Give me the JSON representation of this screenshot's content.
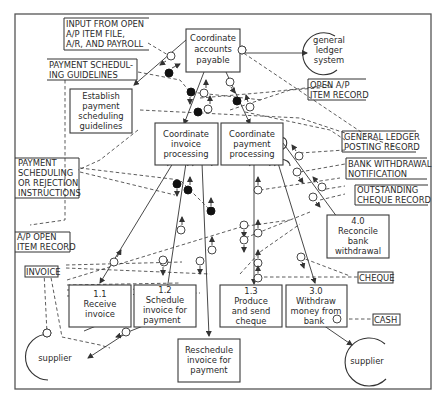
{
  "diagram": {
    "type": "structured-analysis structure chart",
    "modules": {
      "top": {
        "lines": [
          "Coordinate",
          "accounts",
          "payable"
        ]
      },
      "establish": {
        "lines": [
          "Establish",
          "payment",
          "scheduling",
          "guidelines"
        ]
      },
      "invoice_proc": {
        "lines": [
          "Coordinate",
          "invoice",
          "processing"
        ]
      },
      "payment_proc": {
        "lines": [
          "Coordinate",
          "payment",
          "processing"
        ]
      },
      "m11": {
        "lines": [
          "1.1",
          "Receive",
          "invoice"
        ]
      },
      "m12": {
        "lines": [
          "1.2",
          "Schedule",
          "invoice for",
          "payment"
        ]
      },
      "m13": {
        "lines": [
          "1.3",
          "Produce",
          "and send",
          "cheque"
        ]
      },
      "m30": {
        "lines": [
          "3.0",
          "Withdraw",
          "money from",
          "bank"
        ]
      },
      "m40": {
        "lines": [
          "4.0",
          "Reconcile",
          "bank",
          "withdrawal"
        ]
      },
      "reschedule": {
        "lines": [
          "Reschedule",
          "invoice for",
          "payment"
        ]
      }
    },
    "externals": {
      "gl_system": {
        "lines": [
          "general",
          "ledger",
          "system"
        ]
      },
      "supplier_left": {
        "lines": [
          "supplier"
        ]
      },
      "supplier_right": {
        "lines": [
          "supplier"
        ]
      }
    },
    "stores": {
      "input_open_ap": {
        "lines": [
          "INPUT FROM OPEN",
          "A/P ITEM FILE,",
          "A/R, AND PAYROLL"
        ]
      },
      "payment_guidelines": {
        "lines": [
          "PAYMENT SCHEDUL-",
          "ING GUIDELINES"
        ]
      },
      "open_ap_item": {
        "lines": [
          "OPEN A/P",
          "ITEM RECORD"
        ]
      },
      "gl_posting": {
        "lines": [
          "GENERAL LEDGER",
          "POSTING RECORD"
        ]
      },
      "bank_withdrawal": {
        "lines": [
          "BANK WITHDRAWAL",
          "NOTIFICATION"
        ]
      },
      "outstanding_cheque": {
        "lines": [
          "OUTSTANDING",
          "CHEQUE RECORD"
        ]
      },
      "payment_rejection": {
        "lines": [
          "PAYMENT",
          "SCHEDULING",
          "OR REJECTION",
          "INSTRUCTIONS"
        ]
      },
      "ap_open_item": {
        "lines": [
          "A/P OPEN",
          "ITEM RECORD"
        ]
      },
      "invoice": {
        "lines": [
          "INVOICE"
        ]
      },
      "cheque": {
        "lines": [
          "CHEQUE"
        ]
      },
      "cash": {
        "lines": [
          "CASH"
        ]
      }
    },
    "legend": {
      "open_circle": "data couple",
      "filled_circle": "control flag"
    }
  }
}
